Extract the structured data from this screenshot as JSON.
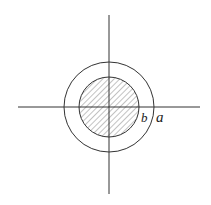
{
  "diagram": {
    "type": "concentric-circles-cross-section",
    "center": [
      109,
      107
    ],
    "outer_radius": 45,
    "inner_radius": 30,
    "inner_fill": "hatched",
    "axes": {
      "horizontal": {
        "x1": 18,
        "x2": 200,
        "y": 107
      },
      "vertical": {
        "x": 109,
        "y1": 15,
        "y2": 194
      }
    },
    "labels": {
      "inner": "b",
      "outer": "a"
    },
    "colors": {
      "stroke": "#333333",
      "hatch": "#555555",
      "background": "#ffffff"
    }
  }
}
